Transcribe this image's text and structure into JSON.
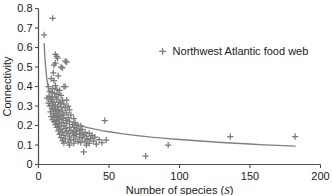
{
  "chart_data": {
    "type": "scatter",
    "title": "",
    "xlabel": "Number of species (S)",
    "xlabel_plain": "Number of species (",
    "xlabel_italic": "S",
    "xlabel_close": ")",
    "ylabel": "Connectivity",
    "xlim": [
      0,
      200
    ],
    "ylim": [
      0,
      0.8
    ],
    "grid": false,
    "legend_position": "inside-upper-right",
    "marker": "plus",
    "marker_color": "#7a7a7a",
    "axis_color": "#4d4d4d",
    "curve_color": "#808080",
    "text_color": "#1a1a1a",
    "xticks": [
      0,
      50,
      100,
      150,
      200
    ],
    "xtick_labels": [
      "0",
      "50",
      "100",
      "150",
      "200"
    ],
    "yticks": [
      0,
      0.1,
      0.2,
      0.3,
      0.4,
      0.5,
      0.6,
      0.7,
      0.8
    ],
    "ytick_labels": [
      "0",
      "0.1",
      "0.2",
      "0.3",
      "0.4",
      "0.5",
      "0.6",
      "0.7",
      "0.8"
    ],
    "series": [
      {
        "name": "Northwest Atlantic food web",
        "marker": "plus",
        "color": "#7a7a7a",
        "points": [
          [
            4,
            0.665
          ],
          [
            10,
            0.75
          ],
          [
            12,
            0.565
          ],
          [
            13,
            0.555
          ],
          [
            13.5,
            0.545
          ],
          [
            12,
            0.52
          ],
          [
            19,
            0.53
          ],
          [
            20,
            0.525
          ],
          [
            16,
            0.5
          ],
          [
            17,
            0.495
          ],
          [
            11,
            0.51
          ],
          [
            10.5,
            0.47
          ],
          [
            14,
            0.455
          ],
          [
            9,
            0.44
          ],
          [
            11,
            0.43
          ],
          [
            7,
            0.4
          ],
          [
            12,
            0.405
          ],
          [
            18,
            0.4
          ],
          [
            19,
            0.4
          ],
          [
            10,
            0.39
          ],
          [
            13,
            0.385
          ],
          [
            15,
            0.38
          ],
          [
            8,
            0.375
          ],
          [
            9.5,
            0.37
          ],
          [
            11.5,
            0.365
          ],
          [
            14,
            0.36
          ],
          [
            16,
            0.355
          ],
          [
            7.5,
            0.35
          ],
          [
            10,
            0.345
          ],
          [
            12.5,
            0.345
          ],
          [
            6,
            0.34
          ],
          [
            8.5,
            0.335
          ],
          [
            13,
            0.335
          ],
          [
            17,
            0.33
          ],
          [
            20,
            0.33
          ],
          [
            9,
            0.325
          ],
          [
            11,
            0.32
          ],
          [
            14.5,
            0.32
          ],
          [
            7,
            0.315
          ],
          [
            15.5,
            0.315
          ],
          [
            18,
            0.31
          ],
          [
            10,
            0.305
          ],
          [
            12,
            0.305
          ],
          [
            21,
            0.3
          ],
          [
            8,
            0.3
          ],
          [
            13.5,
            0.295
          ],
          [
            16,
            0.295
          ],
          [
            19,
            0.29
          ],
          [
            9.5,
            0.285
          ],
          [
            11,
            0.285
          ],
          [
            14,
            0.28
          ],
          [
            22,
            0.28
          ],
          [
            17,
            0.275
          ],
          [
            12,
            0.275
          ],
          [
            8.5,
            0.27
          ],
          [
            15,
            0.27
          ],
          [
            20,
            0.265
          ],
          [
            10.5,
            0.26
          ],
          [
            13,
            0.26
          ],
          [
            18,
            0.255
          ],
          [
            23,
            0.255
          ],
          [
            11.5,
            0.25
          ],
          [
            16,
            0.25
          ],
          [
            9,
            0.245
          ],
          [
            14,
            0.245
          ],
          [
            21,
            0.24
          ],
          [
            12.5,
            0.24
          ],
          [
            17.5,
            0.235
          ],
          [
            25,
            0.235
          ],
          [
            10,
            0.23
          ],
          [
            15,
            0.23
          ],
          [
            19.5,
            0.225
          ],
          [
            47,
            0.225
          ],
          [
            13,
            0.225
          ],
          [
            22,
            0.22
          ],
          [
            11,
            0.22
          ],
          [
            16.5,
            0.215
          ],
          [
            26,
            0.215
          ],
          [
            14,
            0.21
          ],
          [
            20,
            0.21
          ],
          [
            24,
            0.205
          ],
          [
            12,
            0.205
          ],
          [
            18,
            0.2
          ],
          [
            28,
            0.2
          ],
          [
            30,
            0.198
          ],
          [
            15,
            0.195
          ],
          [
            22,
            0.19
          ],
          [
            25,
            0.19
          ],
          [
            13,
            0.19
          ],
          [
            19,
            0.185
          ],
          [
            27,
            0.183
          ],
          [
            31,
            0.18
          ],
          [
            16,
            0.18
          ],
          [
            23,
            0.175
          ],
          [
            29,
            0.175
          ],
          [
            14,
            0.172
          ],
          [
            20,
            0.17
          ],
          [
            26,
            0.168
          ],
          [
            33,
            0.165
          ],
          [
            17,
            0.165
          ],
          [
            24,
            0.162
          ],
          [
            30,
            0.16
          ],
          [
            36,
            0.16
          ],
          [
            21,
            0.158
          ],
          [
            15,
            0.155
          ],
          [
            27,
            0.155
          ],
          [
            32,
            0.152
          ],
          [
            38,
            0.15
          ],
          [
            18,
            0.15
          ],
          [
            25,
            0.148
          ],
          [
            34,
            0.145
          ],
          [
            136,
            0.143
          ],
          [
            182,
            0.143
          ],
          [
            22,
            0.142
          ],
          [
            29,
            0.14
          ],
          [
            40,
            0.14
          ],
          [
            16,
            0.138
          ],
          [
            31,
            0.135
          ],
          [
            37,
            0.133
          ],
          [
            19,
            0.132
          ],
          [
            26,
            0.13
          ],
          [
            35,
            0.128
          ],
          [
            43,
            0.127
          ],
          [
            48,
            0.125
          ],
          [
            23,
            0.125
          ],
          [
            17,
            0.122
          ],
          [
            33,
            0.12
          ],
          [
            39,
            0.12
          ],
          [
            28,
            0.118
          ],
          [
            21,
            0.115
          ],
          [
            30,
            0.112
          ],
          [
            45,
            0.112
          ],
          [
            18,
            0.11
          ],
          [
            25,
            0.11
          ],
          [
            36,
            0.108
          ],
          [
            41,
            0.105
          ],
          [
            92,
            0.1
          ],
          [
            34,
            0.1
          ],
          [
            22,
            0.1
          ],
          [
            32,
            0.065
          ],
          [
            76,
            0.043
          ]
        ]
      }
    ],
    "fit_curve": {
      "form": "power-law decay",
      "color": "#808080",
      "x_start": 4,
      "x_end": 182,
      "points": [
        [
          4,
          0.62
        ],
        [
          4.5,
          0.555
        ],
        [
          5,
          0.505
        ],
        [
          5.5,
          0.465
        ],
        [
          6,
          0.435
        ],
        [
          6.5,
          0.41
        ],
        [
          7,
          0.39
        ],
        [
          7.5,
          0.372
        ],
        [
          8,
          0.357
        ],
        [
          9,
          0.333
        ],
        [
          10,
          0.315
        ],
        [
          11,
          0.3
        ],
        [
          12,
          0.288
        ],
        [
          13,
          0.277
        ],
        [
          14,
          0.268
        ],
        [
          15,
          0.26
        ],
        [
          17,
          0.247
        ],
        [
          19,
          0.236
        ],
        [
          21,
          0.227
        ],
        [
          23,
          0.22
        ],
        [
          25,
          0.213
        ],
        [
          28,
          0.205
        ],
        [
          31,
          0.197
        ],
        [
          35,
          0.189
        ],
        [
          40,
          0.181
        ],
        [
          45,
          0.174
        ],
        [
          50,
          0.168
        ],
        [
          60,
          0.157
        ],
        [
          70,
          0.148
        ],
        [
          80,
          0.14
        ],
        [
          90,
          0.134
        ],
        [
          100,
          0.128
        ],
        [
          110,
          0.123
        ],
        [
          120,
          0.118
        ],
        [
          130,
          0.113
        ],
        [
          140,
          0.109
        ],
        [
          150,
          0.105
        ],
        [
          160,
          0.101
        ],
        [
          170,
          0.098
        ],
        [
          182,
          0.094
        ]
      ]
    },
    "legend": {
      "label": "Northwest Atlantic food web",
      "marker": "plus",
      "x": 88,
      "y": 0.58
    }
  }
}
